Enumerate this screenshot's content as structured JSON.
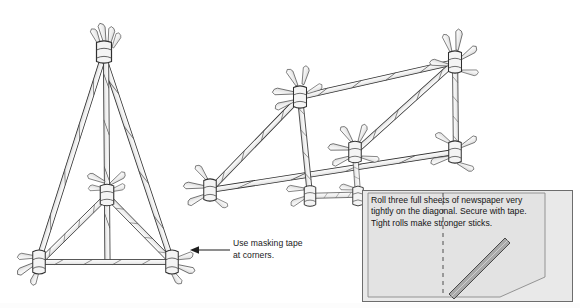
{
  "figure": {
    "background_color": "#ffffff",
    "ink_color": "#2b2b2b",
    "stick_fill": "#f2f2f2",
    "stick_shade": "#d8d8d8"
  },
  "callout": {
    "line1": "Use masking tape",
    "line2": "at corners.",
    "arrow": "left-arrow",
    "text": "Use masking tape at corners."
  },
  "inset": {
    "background_color": "#e9e9e9",
    "border_color": "#6d6d6d",
    "line1": "Roll three full sheets of newspaper very",
    "line2": "tightly on the diagonal. Secure with tape.",
    "line3": "Tight rolls make stronger sticks.",
    "paper_fill": "#e3e3e3",
    "fold_line": "dashed-vertical",
    "roll_color": "#a8a8a8",
    "roll_label": "rolled-newspaper-stick"
  },
  "structures": {
    "tripod": {
      "name": "newspaper-stick-tripod",
      "joint_count": 5,
      "apex_label": "taped-apex-joint",
      "base_label": "triangular-base"
    },
    "frame": {
      "name": "newspaper-stick-rectangular-frame",
      "joint_count": 6,
      "brace_label": "diagonal-brace"
    }
  }
}
